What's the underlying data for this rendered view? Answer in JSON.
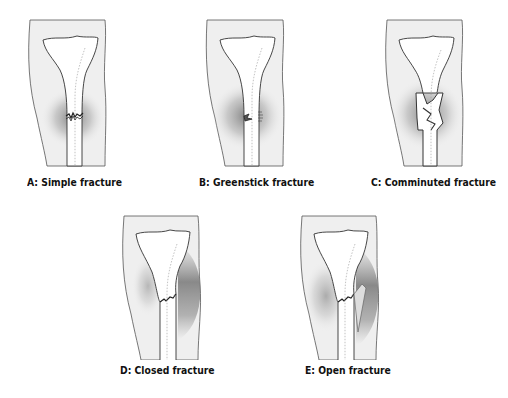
{
  "figure": {
    "panels": [
      {
        "id": "A",
        "label": "A: Simple fracture",
        "fracture_type": "simple"
      },
      {
        "id": "B",
        "label": "B: Greenstick fracture",
        "fracture_type": "greenstick"
      },
      {
        "id": "C",
        "label": "C: Comminuted fracture",
        "fracture_type": "comminuted"
      },
      {
        "id": "D",
        "label": "D: Closed fracture",
        "fracture_type": "closed"
      },
      {
        "id": "E",
        "label": "E: Open fracture",
        "fracture_type": "open"
      }
    ]
  },
  "colors": {
    "leg_fill": "#efefef",
    "bone_fill": "#ffffff",
    "outline": "#444444",
    "bruise": "#6e6e6e"
  }
}
